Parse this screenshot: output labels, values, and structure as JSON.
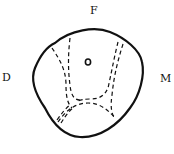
{
  "diagram": {
    "type": "tooth cross-section outline",
    "labels": {
      "top": "F",
      "left": "D",
      "right": "M"
    },
    "colors": {
      "stroke": "#111111",
      "background": "#ffffff"
    }
  }
}
